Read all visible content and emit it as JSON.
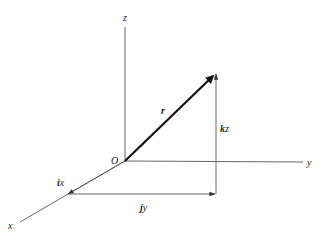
{
  "diagram": {
    "colors": {
      "line": "#555555",
      "vector": "#111111",
      "text": "#222222",
      "background": "#ffffff"
    },
    "origin": {
      "label": "O",
      "x": 125,
      "y": 161
    },
    "axes": [
      {
        "name": "z",
        "label": "z",
        "from": [
          125,
          161
        ],
        "to": [
          125,
          27
        ],
        "label_pos": [
          126,
          21
        ]
      },
      {
        "name": "y",
        "label": "y",
        "from": [
          125,
          161
        ],
        "to": [
          303,
          162
        ],
        "label_pos": [
          310,
          166
        ]
      },
      {
        "name": "x",
        "label": "x",
        "from": [
          125,
          161
        ],
        "to": [
          20,
          222
        ],
        "label_pos": [
          9,
          229
        ]
      }
    ],
    "vectors": [
      {
        "name": "r",
        "label": "r",
        "from": [
          125,
          161
        ],
        "to": [
          216,
          73
        ],
        "style": "bold",
        "label_pos": [
          162,
          112
        ]
      },
      {
        "name": "kz",
        "label_bold": "k",
        "label_rest": "z",
        "from": [
          216,
          194
        ],
        "to": [
          216,
          73
        ],
        "label_pos": [
          221,
          131
        ]
      },
      {
        "name": "jy",
        "label_bold": "j",
        "label_rest": "y",
        "from": [
          68,
          194
        ],
        "to": [
          216,
          194
        ],
        "label_pos": [
          141,
          211
        ]
      },
      {
        "name": "ix",
        "label_bold": "i",
        "label_rest": "x",
        "from": [
          125,
          161
        ],
        "to": [
          68,
          194
        ],
        "label_pos": [
          58,
          185
        ]
      }
    ]
  }
}
